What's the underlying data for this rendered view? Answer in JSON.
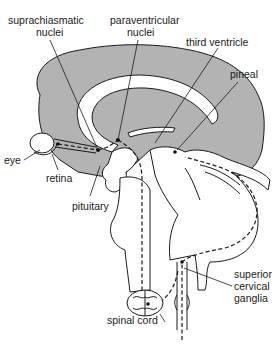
{
  "diagram": {
    "type": "anatomical-pathway",
    "labels": {
      "suprachiasmatic_1": "suprachiasmatic",
      "suprachiasmatic_2": "nuclei",
      "paraventricular_1": "paraventricular",
      "paraventricular_2": "nuclei",
      "third_ventricle": "third ventricle",
      "pineal": "pineal",
      "eye": "eye",
      "retina": "retina",
      "pituitary": "pituitary",
      "superior_cervical_1": "superior",
      "superior_cervical_2": "cervical",
      "superior_cervical_3": "ganglia",
      "spinal_cord": "spinal cord"
    },
    "pathway": [
      "retina",
      "suprachiasmatic nuclei",
      "paraventricular nuclei",
      "spinal cord",
      "superior cervical ganglia",
      "pineal"
    ],
    "colors": {
      "brain_fill": "#b3b3b3",
      "line": "#1a1a1a",
      "background": "#ffffff"
    }
  }
}
